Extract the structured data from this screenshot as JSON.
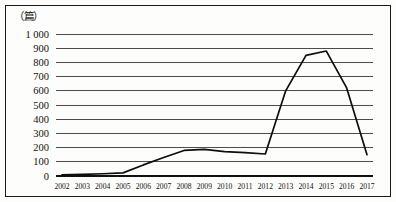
{
  "chart_data": {
    "type": "line",
    "title": "",
    "unit_label": "（篇）",
    "xlabel": "",
    "ylabel": "",
    "ylim": [
      0,
      1000
    ],
    "ytick_labels": [
      "1 000",
      "900",
      "800",
      "700",
      "600",
      "500",
      "400",
      "300",
      "200",
      "100",
      "0"
    ],
    "ytick_values": [
      1000,
      900,
      800,
      700,
      600,
      500,
      400,
      300,
      200,
      100,
      0
    ],
    "grid": true,
    "legend": "none",
    "categories": [
      "2002",
      "2003",
      "2004",
      "2005",
      "2006",
      "2007",
      "2008",
      "2009",
      "2010",
      "2011",
      "2012",
      "2013",
      "2014",
      "2015",
      "2016",
      "2017"
    ],
    "values": [
      8,
      12,
      16,
      22,
      78,
      130,
      180,
      188,
      172,
      165,
      155,
      600,
      850,
      880,
      620,
      150
    ],
    "series": [
      {
        "name": "",
        "values": [
          8,
          12,
          16,
          22,
          78,
          130,
          180,
          188,
          172,
          165,
          155,
          600,
          850,
          880,
          620,
          150
        ]
      }
    ]
  },
  "figure": {
    "unit": "（篇）"
  }
}
